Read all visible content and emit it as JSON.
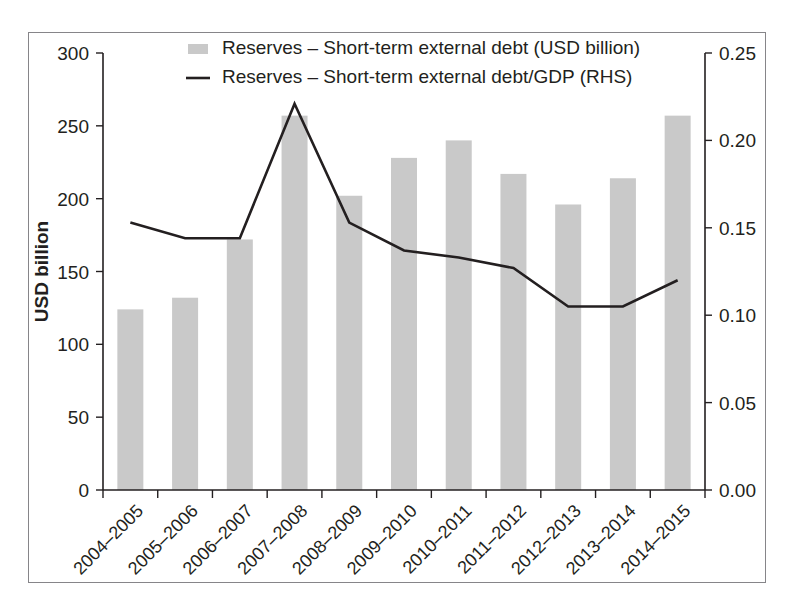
{
  "figure": {
    "frame_border_color": "#868589",
    "background": "#ffffff"
  },
  "chart_data": {
    "type": "bar",
    "title": "",
    "subtitle": "",
    "xlabel": "",
    "ylabel": "USD billion",
    "ylabel_right": "",
    "ylim": [
      0,
      300
    ],
    "yticks": [
      0,
      50,
      100,
      150,
      200,
      250,
      300
    ],
    "ytick_labels": [
      "0",
      "50",
      "100",
      "150",
      "200",
      "250",
      "300"
    ],
    "ylim_right": [
      0.0,
      0.25
    ],
    "yticks_right": [
      0.0,
      0.05,
      0.1,
      0.15,
      0.2,
      0.25
    ],
    "ytick_labels_right": [
      "0.00",
      "0.05",
      "0.10",
      "0.15",
      "0.20",
      "0.25"
    ],
    "grid": false,
    "legend_position": "top-center",
    "categories": [
      "2004–2005",
      "2005–2006",
      "2006–2007",
      "2007–2008",
      "2008–2009",
      "2009–2010",
      "2010–2011",
      "2011–2012",
      "2012–2013",
      "2013–2014",
      "2014–2015"
    ],
    "series": [
      {
        "name": "Reserves – Short-term external debt (USD billion)",
        "type": "bar",
        "axis": "left",
        "color": "#c9c9c9",
        "values": [
          124,
          132,
          172,
          257,
          202,
          228,
          240,
          217,
          196,
          214,
          257
        ]
      },
      {
        "name": "Reserves – Short-term external debt/GDP (RHS)",
        "type": "line",
        "axis": "right",
        "color": "#231f20",
        "values": [
          0.153,
          0.144,
          0.144,
          0.221,
          0.153,
          0.137,
          0.133,
          0.127,
          0.105,
          0.105,
          0.12
        ]
      }
    ]
  },
  "legend": {
    "items": [
      {
        "label": "Reserves – Short-term external debt (USD billion)",
        "marker": "swatch",
        "color": "#c9c9c9"
      },
      {
        "label": "Reserves – Short-term external debt/GDP (RHS)",
        "marker": "line",
        "color": "#231f20"
      }
    ]
  }
}
